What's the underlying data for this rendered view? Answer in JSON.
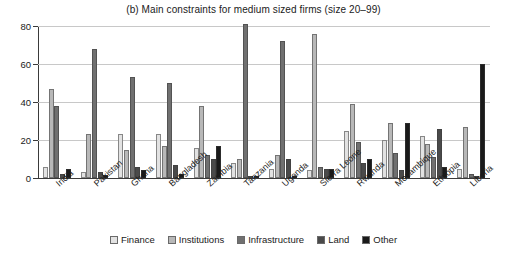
{
  "chart_data": {
    "type": "bar",
    "title": "(b) Main constraints for medium sized firms (size 20–99)",
    "xlabel": "",
    "ylabel": "",
    "ylim": [
      0,
      80
    ],
    "yticks": [
      0,
      20,
      40,
      60,
      80
    ],
    "ytick_labels": [
      "0",
      "20",
      "40",
      "60",
      "80"
    ],
    "grid": true,
    "legend_position": "bottom",
    "categories": [
      "India",
      "Pakistan",
      "Ghana",
      "Bangladesh",
      "Zambia",
      "Tanzania",
      "Uganda",
      "Sierra Leone",
      "Rwanda",
      "Mozambique",
      "Ethiopia",
      "Liberia"
    ],
    "series": [
      {
        "name": "Finance",
        "color": "#e2e2e2",
        "values": [
          6,
          3,
          23,
          23,
          16,
          8,
          5,
          4,
          25,
          20,
          22,
          5
        ]
      },
      {
        "name": "Institutions",
        "color": "#b8b8b8",
        "values": [
          47,
          23,
          15,
          17,
          38,
          10,
          12,
          76,
          39,
          29,
          18,
          27
        ]
      },
      {
        "name": "Infrastructure",
        "color": "#707070",
        "values": [
          38,
          68,
          53,
          50,
          12,
          81,
          72,
          6,
          19,
          13,
          11,
          2
        ]
      },
      {
        "name": "Land",
        "color": "#4a4a4a",
        "values": [
          2,
          3,
          6,
          7,
          10,
          1,
          10,
          5,
          8,
          4,
          26,
          1
        ]
      },
      {
        "name": "Other",
        "color": "#1a1a1a",
        "values": [
          5,
          1.5,
          4,
          2,
          17,
          0.5,
          1,
          5,
          10,
          29,
          6,
          60
        ]
      }
    ]
  }
}
